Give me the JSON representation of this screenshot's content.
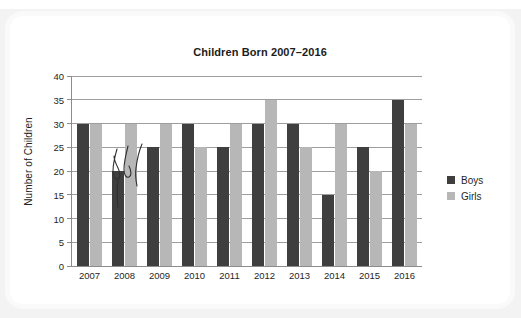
{
  "page": {
    "cut_header_text": "",
    "card_background": "#ffffff",
    "page_background": "#f3f3f3"
  },
  "chart_data": {
    "type": "bar",
    "title": "Children Born 2007–2016",
    "xlabel": "",
    "ylabel": "Number of Children",
    "categories": [
      "2007",
      "2008",
      "2009",
      "2010",
      "2011",
      "2012",
      "2013",
      "2014",
      "2015",
      "2016"
    ],
    "series": [
      {
        "name": "Boys",
        "color": "#3f3f3f",
        "values": [
          30,
          20,
          25,
          30,
          25,
          30,
          30,
          15,
          25,
          35
        ]
      },
      {
        "name": "Girls",
        "color": "#b7b7b7",
        "values": [
          30,
          30,
          30,
          25,
          30,
          35,
          25,
          30,
          20,
          30
        ]
      }
    ],
    "ylim": [
      0,
      40
    ],
    "ytick_step": 5,
    "yticks": [
      "0",
      "5",
      "10",
      "15",
      "20",
      "25",
      "30",
      "35",
      "40"
    ],
    "grid": "horizontal",
    "legend_position": "right",
    "annotations": [
      {
        "kind": "handwritten-pen-marks",
        "near_category": "2008",
        "description": "curved ink strokes drawn over the 2008 bars"
      }
    ]
  },
  "legend": {
    "items": [
      {
        "label": "Boys",
        "color": "#3f3f3f"
      },
      {
        "label": "Girls",
        "color": "#b7b7b7"
      }
    ]
  }
}
